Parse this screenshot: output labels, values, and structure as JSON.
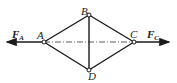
{
  "diagram": {
    "type": "truss-rhombus",
    "joints": [
      {
        "id": "A",
        "label": "A",
        "x": 44,
        "y": 42
      },
      {
        "id": "B",
        "label": "B",
        "x": 89,
        "y": 15
      },
      {
        "id": "C",
        "label": "C",
        "x": 134,
        "y": 42
      },
      {
        "id": "D",
        "label": "D",
        "x": 89,
        "y": 70
      }
    ],
    "members": [
      [
        "A",
        "B"
      ],
      [
        "B",
        "C"
      ],
      [
        "C",
        "D"
      ],
      [
        "D",
        "A"
      ],
      [
        "B",
        "D"
      ]
    ],
    "centerline": {
      "from": "A",
      "to": "C",
      "style": "dash-dot"
    },
    "forces": [
      {
        "name": "F_A",
        "symbol": "F",
        "subscript": "A",
        "at": "A",
        "direction": "left"
      },
      {
        "name": "F_C",
        "symbol": "F",
        "subscript": "C",
        "at": "C",
        "direction": "right"
      }
    ],
    "colors": {
      "line": "#1a1a1a",
      "background": "#ffffff"
    }
  }
}
